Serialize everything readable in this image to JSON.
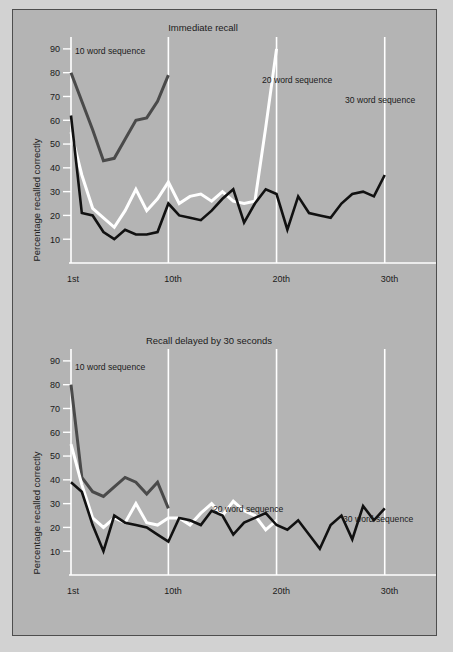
{
  "figure": {
    "background_color": "#b4b4b4",
    "page_color": "#d2d2d2",
    "border_color": "#4e4e4e"
  },
  "colors": {
    "grid_white": "#ffffff",
    "series_10_word": "#4a4a4a",
    "series_20_word": "#ffffff",
    "series_30_word": "#111111",
    "text": "#1b1b1b"
  },
  "axis": {
    "y_label": "Percentage recalled correctly",
    "y_ticks": [
      90,
      80,
      70,
      60,
      50,
      40,
      30,
      20,
      10
    ],
    "y_min": 0,
    "y_max": 95,
    "x_ticks": [
      1,
      10,
      20,
      30
    ],
    "x_tick_labels": [
      "1st",
      "10th",
      "20th",
      "30th"
    ],
    "x_min": 1,
    "x_max": 34
  },
  "labels": {
    "series_10": "10 word sequence",
    "series_20": "20 word sequence",
    "series_30": "30 word sequence"
  },
  "chart_data": [
    {
      "id": "immediate-recall",
      "type": "line",
      "title": "Immediate recall",
      "xlabel": "",
      "ylabel": "Percentage recalled correctly",
      "xlim": [
        1,
        34
      ],
      "ylim": [
        0,
        95
      ],
      "x_tick_values": [
        1,
        10,
        20,
        30
      ],
      "x_tick_labels": [
        "1st",
        "10th",
        "20th",
        "30th"
      ],
      "y_tick_values": [
        10,
        20,
        30,
        40,
        50,
        60,
        70,
        80,
        90
      ],
      "grid": "vertical-white-gridlines",
      "legend": "inline-annotations",
      "series": [
        {
          "name": "10 word sequence",
          "color": "#4a4a4a",
          "x": [
            1,
            2,
            3,
            4,
            5,
            6,
            7,
            8,
            9,
            10
          ],
          "values": [
            80,
            68,
            56,
            43,
            44,
            52,
            60,
            61,
            68,
            79
          ]
        },
        {
          "name": "20 word sequence",
          "color": "#ffffff",
          "x": [
            1,
            2,
            3,
            4,
            5,
            6,
            7,
            8,
            9,
            10,
            11,
            12,
            13,
            14,
            15,
            16,
            17,
            18,
            19,
            20
          ],
          "values": [
            55,
            37,
            23,
            19,
            15,
            22,
            31,
            22,
            27,
            34,
            25,
            28,
            29,
            26,
            30,
            26,
            25,
            26,
            57,
            90
          ]
        },
        {
          "name": "30 word sequence",
          "color": "#111111",
          "x": [
            1,
            2,
            3,
            4,
            5,
            6,
            7,
            8,
            9,
            10,
            11,
            12,
            13,
            14,
            15,
            16,
            17,
            18,
            19,
            20,
            21,
            22,
            23,
            24,
            25,
            26,
            27,
            28,
            29,
            30
          ],
          "values": [
            62,
            21,
            20,
            13,
            10,
            14,
            12,
            12,
            13,
            25,
            20,
            19,
            18,
            22,
            27,
            31,
            17,
            25,
            31,
            29,
            14,
            28,
            21,
            20,
            19,
            25,
            29,
            30,
            28,
            37
          ]
        }
      ]
    },
    {
      "id": "delayed-recall",
      "type": "line",
      "title": "Recall delayed by 30 seconds",
      "xlabel": "",
      "ylabel": "Percentage recalled correctly",
      "xlim": [
        1,
        34
      ],
      "ylim": [
        0,
        95
      ],
      "x_tick_values": [
        1,
        10,
        20,
        30
      ],
      "x_tick_labels": [
        "1st",
        "10th",
        "20th",
        "30th"
      ],
      "y_tick_values": [
        10,
        20,
        30,
        40,
        50,
        60,
        70,
        80,
        90
      ],
      "grid": "vertical-white-gridlines",
      "legend": "inline-annotations",
      "series": [
        {
          "name": "10 word sequence",
          "color": "#4a4a4a",
          "x": [
            1,
            2,
            3,
            4,
            5,
            6,
            7,
            8,
            9,
            10
          ],
          "values": [
            80,
            41,
            35,
            33,
            37,
            41,
            39,
            34,
            39,
            28
          ]
        },
        {
          "name": "20 word sequence",
          "color": "#ffffff",
          "x": [
            1,
            2,
            3,
            4,
            5,
            6,
            7,
            8,
            9,
            10,
            11,
            12,
            13,
            14,
            15,
            16,
            17,
            18,
            19,
            20
          ],
          "values": [
            55,
            38,
            24,
            20,
            24,
            22,
            30,
            22,
            21,
            24,
            24,
            21,
            26,
            30,
            25,
            31,
            27,
            25,
            19,
            23
          ]
        },
        {
          "name": "30 word sequence",
          "color": "#111111",
          "x": [
            1,
            2,
            3,
            4,
            5,
            6,
            7,
            8,
            9,
            10,
            11,
            12,
            13,
            14,
            15,
            16,
            17,
            18,
            19,
            20,
            21,
            22,
            23,
            24,
            25,
            26,
            27,
            28,
            29,
            30
          ],
          "values": [
            39,
            35,
            21,
            10,
            25,
            22,
            21,
            20,
            17,
            14,
            24,
            23,
            21,
            27,
            25,
            17,
            22,
            24,
            26,
            21,
            19,
            23,
            17,
            11,
            21,
            25,
            15,
            29,
            23,
            28
          ]
        }
      ]
    }
  ]
}
